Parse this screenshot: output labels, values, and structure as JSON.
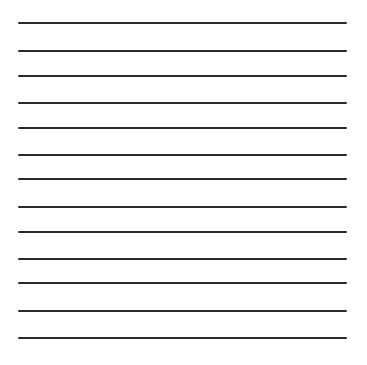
{
  "sheet": {
    "background": "#ffffff",
    "line_color": "#2b2b2b",
    "line_thickness": 2,
    "line_start_x": 18,
    "line_end_x": 347,
    "line_count": 13,
    "lines_y": [
      23,
      51,
      76,
      103,
      128,
      155,
      179,
      207,
      232,
      259,
      283,
      311,
      338
    ]
  }
}
